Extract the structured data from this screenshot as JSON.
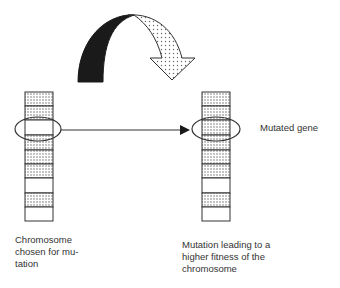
{
  "diagram": {
    "type": "mutation-illustration",
    "mutation_arrow_icon": "curved-arrow-icon",
    "left_chromosome": {
      "label": "Chromosome\nchosen for mu-\ntation",
      "segments": [
        "dotted",
        "dotted",
        "white",
        "dotted",
        "dotted",
        "dotted",
        "white",
        "dotted",
        "white"
      ],
      "highlighted_index": 2
    },
    "right_chromosome": {
      "label": "Mutation leading to a\nhigher fitness of the\nchromosome",
      "segments": [
        "dotted",
        "dotted",
        "dotted",
        "dotted",
        "dotted",
        "dotted",
        "white",
        "dotted",
        "white"
      ],
      "highlighted_index": 2
    },
    "mutated_gene_label": "Mutated gene",
    "colors": {
      "outline": "#333333",
      "dot_fill": "#9a9a9a",
      "arrow_dark": "#1a1a1a",
      "background": "#ffffff"
    }
  }
}
